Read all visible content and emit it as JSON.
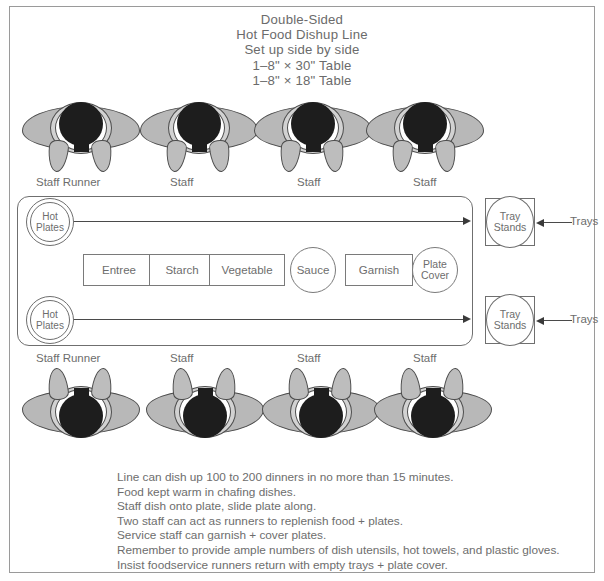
{
  "title": {
    "lines": [
      "Double-Sided",
      "Hot Food Dishup Line",
      "Set up side by side",
      "1–8\" × 30\" Table",
      "1–8\" × 18\" Table"
    ]
  },
  "staff_top": [
    {
      "label": "Staff Runner"
    },
    {
      "label": "Staff"
    },
    {
      "label": "Staff"
    },
    {
      "label": "Staff"
    }
  ],
  "staff_bottom": [
    {
      "label": "Staff Runner"
    },
    {
      "label": "Staff"
    },
    {
      "label": "Staff"
    },
    {
      "label": "Staff"
    }
  ],
  "line": {
    "hot_plates_top": {
      "line1": "Hot",
      "line2": "Plates"
    },
    "hot_plates_bottom": {
      "line1": "Hot",
      "line2": "Plates"
    },
    "stations": [
      {
        "name": "Entree",
        "shape": "rect"
      },
      {
        "name": "Starch",
        "shape": "rect"
      },
      {
        "name": "Vegetable",
        "shape": "rect"
      },
      {
        "name": "Sauce",
        "shape": "circle"
      },
      {
        "name": "Garnish",
        "shape": "rect"
      },
      {
        "name": "Plate Cover",
        "shape": "circle",
        "line1": "Plate",
        "line2": "Cover"
      }
    ]
  },
  "tray_stands": [
    {
      "line1": "Tray",
      "line2": "Stands",
      "callout": "Trays"
    },
    {
      "line1": "Tray",
      "line2": "Stands",
      "callout": "Trays"
    }
  ],
  "notes": [
    "Line can dish up 100 to 200 dinners in no more than 15 minutes.",
    "Food kept warm in chafing dishes.",
    "Staff dish onto plate, slide plate along.",
    "Two staff can act as runners to replenish food + plates.",
    "Service staff can garnish + cover plates.",
    "Remember to provide ample numbers of dish utensils, hot towels, and plastic gloves.",
    "Insist foodservice runners return with empty trays + plate cover."
  ],
  "colors": {
    "frame": "#9a9a9a",
    "stroke": "#6f6f6f",
    "text": "#6d6d6d",
    "figure_body": "#b8b8b8",
    "figure_head": "#1d1d1d"
  }
}
